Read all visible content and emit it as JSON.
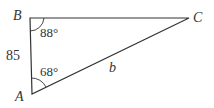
{
  "diagram": {
    "type": "triangle",
    "vertices": [
      {
        "name": "B",
        "x": 30,
        "y": 18
      },
      {
        "name": "C",
        "x": 189,
        "y": 18
      },
      {
        "name": "A",
        "x": 32,
        "y": 94
      }
    ],
    "labels": {
      "vertex_a": "A",
      "vertex_b": "B",
      "vertex_c": "C",
      "angle_b": "88°",
      "angle_a": "68°",
      "side_ab": "85",
      "side_ac": "b"
    },
    "colors": {
      "line": "#333333",
      "text": "#333333"
    }
  }
}
